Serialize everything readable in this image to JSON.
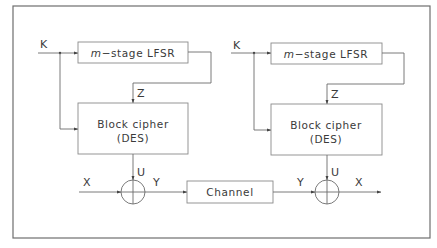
{
  "diagram": {
    "encryptor": {
      "key_label": "K",
      "lfsr_label_italic": "m",
      "lfsr_label_rest": "−stage  LFSR",
      "z_label": "Z",
      "cipher_line1": "Block  cipher",
      "cipher_line2": "(DES)",
      "u_label": "U",
      "input_label": "X",
      "output_label": "Y"
    },
    "channel": {
      "label": "Channel"
    },
    "decryptor": {
      "key_label": "K",
      "lfsr_label_italic": "m",
      "lfsr_label_rest": "−stage  LFSR",
      "z_label": "Z",
      "cipher_line1": "Block  cipher",
      "cipher_line2": "(DES)",
      "u_label": "U",
      "input_label": "Y",
      "output_label": "X"
    },
    "colors": {
      "line": "#6b6b6b",
      "text": "#3a3a3a",
      "background": "#ffffff"
    }
  }
}
